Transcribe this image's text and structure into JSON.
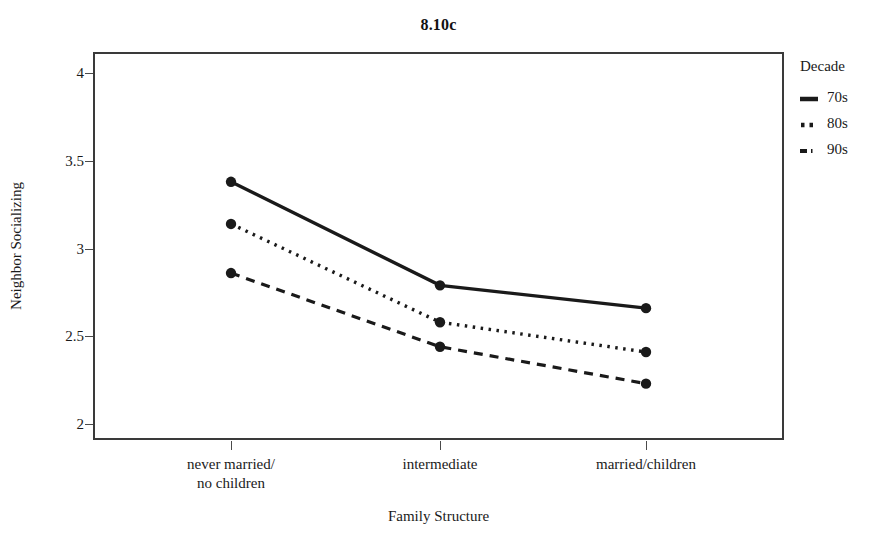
{
  "chart_data": {
    "type": "line",
    "title": "8.10c",
    "xlabel": "Family Structure",
    "ylabel": "Neighbor Socializing",
    "categories": [
      "never married/\nno children",
      "intermediate",
      "married/children"
    ],
    "series": [
      {
        "name": "70s",
        "values": [
          3.38,
          2.79,
          2.66
        ],
        "style": "solid"
      },
      {
        "name": "80s",
        "values": [
          3.14,
          2.58,
          2.41
        ],
        "style": "dotted"
      },
      {
        "name": "90s",
        "values": [
          2.86,
          2.44,
          2.23
        ],
        "style": "dashed"
      }
    ],
    "ylim": [
      1.9,
      4.1
    ],
    "yticks": [
      2,
      2.5,
      3,
      3.5,
      4
    ],
    "ytick_labels": [
      "2",
      "2.5",
      "3",
      "3.5",
      "4"
    ],
    "grid": false,
    "legend_position": "right",
    "legend_title": "Decade",
    "line_color": "#1a1a1a",
    "marker": "filled-circle"
  },
  "axes": {
    "y_title": "Neighbor Socializing",
    "x_title": "Family Structure",
    "tick_labels_y": [
      "4",
      "3.5",
      "3",
      "2.5",
      "2"
    ],
    "tick_labels_x": [
      "never married/\nno children",
      "intermediate",
      "married/children"
    ]
  },
  "legend": {
    "title": "Decade",
    "entries": [
      {
        "label": "70s",
        "swatch": "solid-line-swatch"
      },
      {
        "label": "80s",
        "swatch": "dotted-line-swatch"
      },
      {
        "label": "90s",
        "swatch": "dashed-line-swatch"
      }
    ]
  },
  "header": {
    "title": "8.10c"
  },
  "colors": {
    "ink": "#1a1a1a",
    "frame": "#3a3a3a",
    "background": "#ffffff"
  }
}
